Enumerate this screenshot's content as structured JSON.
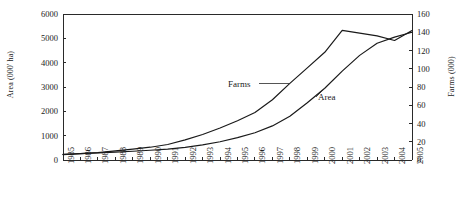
{
  "chart_data": {
    "type": "line",
    "title": "",
    "xlabel": "",
    "grid": false,
    "legend_position": "inline-annotations",
    "x": [
      1985,
      1986,
      1987,
      1988,
      1989,
      1990,
      1991,
      1992,
      1993,
      1994,
      1995,
      1996,
      1997,
      1998,
      1999,
      2000,
      2001,
      2002,
      2003,
      2004,
      2005
    ],
    "x_tick_labels": [
      "1985",
      "1986",
      "1987",
      "1988",
      "1989",
      "1990",
      "1991",
      "1992",
      "1993",
      "1994",
      "1995",
      "1996",
      "1997",
      "1998",
      "1999",
      "2000",
      "2001",
      "2002",
      "2003",
      "2004",
      "2005"
    ],
    "axes": [
      {
        "id": "left",
        "label": "Area (000' ha)",
        "ylim": [
          0,
          6000
        ],
        "ticks": [
          0,
          1000,
          2000,
          3000,
          4000,
          5000,
          6000
        ],
        "tick_labels": [
          "0",
          "1000",
          "2000",
          "3000",
          "4000",
          "5000",
          "6000"
        ]
      },
      {
        "id": "right",
        "label": "Farms (000)",
        "ylim": [
          0,
          160
        ],
        "ticks": [
          0,
          20,
          40,
          60,
          80,
          100,
          120,
          140,
          160
        ],
        "tick_labels": [
          "0",
          "20",
          "40",
          "60",
          "80",
          "100",
          "120",
          "140",
          "160"
        ]
      }
    ],
    "series": [
      {
        "name": "Farms",
        "axis": "right",
        "units": "000",
        "values": [
          6,
          7,
          8,
          10,
          12,
          14,
          17,
          22,
          28,
          35,
          43,
          52,
          66,
          84,
          101,
          118,
          142,
          139,
          136,
          131,
          142
        ]
      },
      {
        "name": "Area",
        "axis": "left",
        "units": "000' ha",
        "values": [
          230,
          260,
          290,
          320,
          360,
          400,
          450,
          520,
          620,
          750,
          920,
          1120,
          1400,
          1800,
          2350,
          2950,
          3650,
          4300,
          4800,
          5050,
          5250
        ]
      }
    ],
    "annotations": [
      {
        "text": "Farms",
        "series": "Farms"
      },
      {
        "text": "Area",
        "series": "Area"
      }
    ]
  }
}
